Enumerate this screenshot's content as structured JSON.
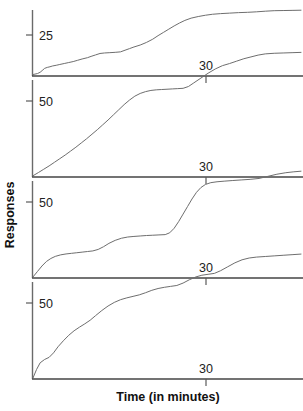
{
  "figure": {
    "title": "",
    "y_axis_label": "Responses",
    "x_axis_label": "Time (in minutes)",
    "line_color": "#6e6e6e",
    "axis_color": "#444444",
    "text_color": "#222222"
  },
  "chart_data": {
    "type": "line",
    "subtitle": "",
    "xlabel": "Time (in minutes)",
    "ylabel": "Responses",
    "grid": false,
    "legend": "none",
    "panel_count": 4,
    "shared_x": {
      "ticks": [
        30
      ],
      "tick_labels": [
        "30"
      ],
      "xlim": [
        0,
        60
      ]
    },
    "panels": [
      {
        "index": 1,
        "name": "panel-1",
        "ylabel_ticks": [
          25
        ],
        "ylabel_tick_labels": [
          "25"
        ],
        "ylim": [
          0,
          45
        ],
        "xlim": [
          0,
          60
        ],
        "x_ticks": [
          30
        ],
        "x_tick_labels": [
          "30"
        ],
        "series": [
          {
            "name": "cumulative-record-1",
            "x": [
              0.0,
              1.0,
              1.6,
              2.2,
              2.6,
              3.2,
              3.8,
              4.4,
              5.2,
              6.0,
              7.0,
              8.0,
              9.0,
              10.0,
              11.0,
              12.2,
              13.0,
              14.0,
              15.0,
              16.0,
              17.2,
              18.4,
              19.6,
              20.6,
              21.6,
              22.6,
              24.0,
              25.4,
              26.8,
              28.0,
              29.2,
              30.4,
              31.6,
              32.8,
              34.0,
              35.4,
              37.0,
              38.6,
              40.2,
              42.0,
              44.0,
              46.0,
              48.0,
              50.0,
              52.0,
              54.0,
              56.0,
              58.0,
              60.0
            ],
            "y": [
              0.6,
              1.2,
              2.0,
              3.4,
              4.4,
              5.0,
              5.4,
              5.9,
              6.3,
              6.8,
              7.4,
              8.0,
              8.6,
              9.4,
              10.2,
              11.0,
              11.8,
              12.7,
              13.6,
              13.9,
              14.1,
              14.3,
              14.6,
              15.6,
              16.6,
              17.6,
              18.8,
              20.4,
              22.4,
              24.6,
              26.6,
              28.6,
              30.6,
              32.4,
              34.0,
              35.4,
              36.4,
              37.2,
              37.8,
              38.2,
              38.5,
              38.8,
              39.0,
              39.3,
              39.7,
              40.0,
              40.1,
              40.2,
              40.3
            ]
          }
        ]
      },
      {
        "index": 2,
        "name": "panel-2",
        "ylabel_ticks": [
          50
        ],
        "ylabel_tick_labels": [
          "50"
        ],
        "ylim": [
          0,
          90
        ],
        "xlim": [
          0,
          60
        ],
        "x_ticks": [
          30
        ],
        "x_tick_labels": [
          "30"
        ],
        "series": [
          {
            "name": "cumulative-record-2",
            "x": [
              0.0,
              1.2,
              2.4,
              3.6,
              4.8,
              6.0,
              7.2,
              8.4,
              9.6,
              10.8,
              12.0,
              13.2,
              14.4,
              15.6,
              16.8,
              18.0,
              19.2,
              20.4,
              21.6,
              22.8,
              24.0,
              25.2,
              26.4,
              27.6,
              28.8,
              30.0,
              31.2,
              32.4,
              33.6,
              34.8,
              36.0,
              37.6,
              39.2,
              40.8,
              42.4,
              44.0,
              45.6,
              47.2,
              48.8,
              50.4,
              52.0,
              54.0,
              56.0,
              58.0,
              60.0
            ],
            "y": [
              0.5,
              2.6,
              4.8,
              7.0,
              9.4,
              11.8,
              14.2,
              16.8,
              19.4,
              22.2,
              25.0,
              28.0,
              31.0,
              34.2,
              37.4,
              40.8,
              44.2,
              47.6,
              50.6,
              53.2,
              55.0,
              56.2,
              57.0,
              57.4,
              57.6,
              57.8,
              58.0,
              58.2,
              58.4,
              59.6,
              62.0,
              65.2,
              68.4,
              71.2,
              73.4,
              74.8,
              76.4,
              78.0,
              79.2,
              80.4,
              81.2,
              81.6,
              81.8,
              82.0,
              82.2
            ]
          }
        ]
      },
      {
        "index": 3,
        "name": "panel-3",
        "ylabel_ticks": [
          50
        ],
        "ylabel_tick_labels": [
          "50"
        ],
        "ylim": [
          0,
          90
        ],
        "xlim": [
          0,
          60
        ],
        "x_ticks": [
          30
        ],
        "x_tick_labels": [
          "30"
        ],
        "series": [
          {
            "name": "cumulative-record-3",
            "x": [
              0.0,
              1.0,
              2.0,
              3.0,
              4.0,
              5.0,
              6.2,
              7.4,
              8.6,
              9.8,
              11.0,
              12.2,
              13.4,
              14.6,
              15.8,
              17.0,
              18.4,
              19.8,
              21.2,
              22.6,
              24.0,
              25.4,
              26.8,
              28.2,
              29.6,
              30.6,
              31.6,
              32.6,
              33.6,
              34.6,
              35.6,
              36.6,
              37.6,
              38.6,
              39.8,
              41.2,
              42.8,
              44.6,
              46.6,
              48.6,
              50.6,
              52.6,
              54.6,
              56.6,
              58.4,
              60.0
            ],
            "y": [
              0.4,
              4.0,
              7.6,
              10.6,
              12.6,
              14.0,
              15.0,
              15.6,
              16.0,
              16.4,
              16.8,
              17.2,
              17.6,
              18.6,
              20.4,
              22.6,
              24.6,
              26.0,
              26.8,
              27.2,
              27.5,
              27.8,
              28.0,
              28.2,
              28.4,
              29.6,
              32.6,
              37.0,
              42.0,
              47.0,
              52.0,
              56.4,
              59.6,
              61.6,
              62.8,
              63.4,
              63.8,
              64.2,
              64.6,
              65.0,
              65.6,
              67.0,
              68.4,
              69.4,
              70.0,
              70.4
            ]
          }
        ]
      },
      {
        "index": 4,
        "name": "panel-4",
        "ylabel_ticks": [
          50
        ],
        "ylabel_tick_labels": [
          "50"
        ],
        "ylim": [
          0,
          90
        ],
        "xlim": [
          0,
          60
        ],
        "x_ticks": [
          30
        ],
        "x_tick_labels": [
          "30"
        ],
        "series": [
          {
            "name": "cumulative-record-4",
            "x": [
              0.0,
              0.8,
              1.6,
              2.6,
              3.6,
              4.6,
              5.6,
              6.8,
              8.0,
              9.2,
              10.4,
              11.6,
              12.8,
              14.0,
              15.4,
              16.8,
              18.2,
              19.6,
              21.0,
              22.4,
              23.8,
              25.2,
              26.6,
              28.0,
              29.4,
              30.8,
              32.2,
              33.6,
              35.0,
              36.4,
              37.8,
              39.2,
              40.6,
              42.0,
              43.6,
              45.2,
              46.8,
              48.4,
              50.0,
              52.0,
              54.0,
              56.0,
              58.0,
              60.0
            ],
            "y": [
              0.4,
              6.0,
              10.4,
              12.6,
              14.0,
              17.0,
              21.0,
              25.0,
              28.6,
              31.6,
              34.0,
              36.2,
              38.6,
              41.6,
              45.0,
              48.0,
              50.4,
              52.2,
              53.4,
              54.4,
              55.4,
              56.8,
              58.4,
              59.6,
              60.4,
              61.0,
              61.6,
              63.2,
              65.4,
              67.2,
              68.4,
              69.0,
              69.6,
              71.4,
              74.0,
              76.6,
              78.6,
              79.8,
              80.4,
              80.8,
              81.2,
              81.6,
              82.0,
              82.4
            ]
          }
        ]
      }
    ]
  }
}
